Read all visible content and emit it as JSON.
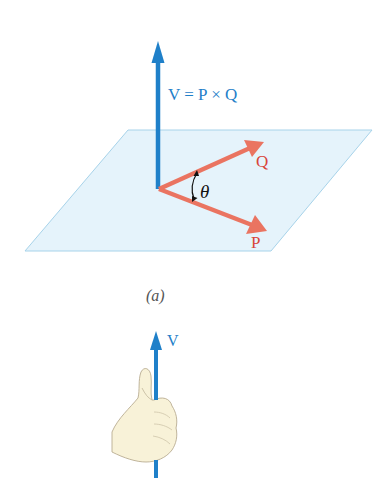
{
  "figure_a": {
    "equation_label": "V = P × Q",
    "vector_q_label": "Q",
    "vector_p_label": "P",
    "angle_label": "θ",
    "caption": "(a)"
  },
  "figure_b": {
    "vector_v_label": "V"
  },
  "colors": {
    "vector_v": "#1f80c9",
    "vectors_pq": "#ea7461",
    "label_pq": "#d9443a",
    "plane_fill": "#e5f3fb",
    "plane_edge": "#a7d3ea",
    "hand_fill": "#f8f2d8",
    "hand_outline": "#b9ad92",
    "caption": "#555555"
  }
}
